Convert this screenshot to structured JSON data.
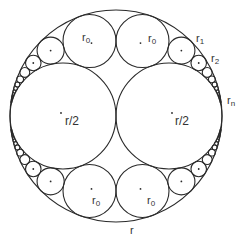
{
  "figure": {
    "type": "circle-packing",
    "stroke_color": "#2a2a2a",
    "background": "#ffffff",
    "outer": {
      "cx": 116,
      "cy": 116,
      "R": 106
    },
    "chain_depth": 14
  },
  "labels": {
    "outer": "r",
    "big_left": "r/2",
    "big_right": "r/2",
    "r0_top_left": "r",
    "r0_top_left_sub": "0",
    "r0_top_right": "r",
    "r0_top_right_sub": "0",
    "r0_bottom_left": "r",
    "r0_bottom_left_sub": "0",
    "r0_bottom_right": "r",
    "r0_bottom_right_sub": "0",
    "r1": "r",
    "r1_sub": "1",
    "r2": "r",
    "r2_sub": "2",
    "rn": "r",
    "rn_sub": "n"
  }
}
